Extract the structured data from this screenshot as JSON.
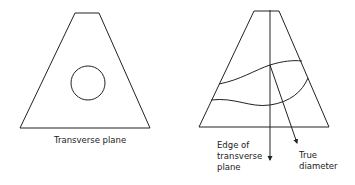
{
  "left_figure": {
    "label": "Transverse plane"
  },
  "right_figure": {
    "edge_label": {
      "line1": "Edge of",
      "line2": "transverse",
      "line3": "plane"
    },
    "diameter_label": {
      "line1": "True",
      "line2": "diameter"
    }
  },
  "colors": {
    "stroke": "#222222",
    "background": "#ffffff"
  }
}
